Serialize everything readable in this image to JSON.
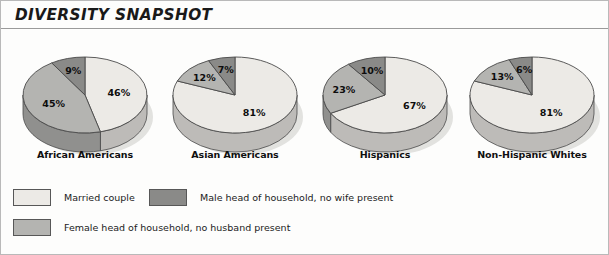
{
  "header": {
    "title": "DIVERSITY SNAPSHOT"
  },
  "colors": {
    "married": "#eceae6",
    "female_head": "#b4b4b1",
    "male_head": "#8a8a88",
    "outline": "#4a4a4a",
    "text": "#0d0d0d",
    "rule": "#9a9a9a",
    "page_border": "#b9b9b9"
  },
  "legend": {
    "items": [
      {
        "label": "Married couple",
        "key": "married"
      },
      {
        "label": "Male head of household, no wife present",
        "key": "male_head"
      },
      {
        "label": "Female head of household, no husband present",
        "key": "female_head"
      }
    ]
  },
  "chart_data": {
    "type": "pie",
    "title": "DIVERSITY SNAPSHOT",
    "xlabel": "",
    "ylabel": "",
    "units": "percent",
    "legend_position": "bottom-left",
    "grid": false,
    "categories": [
      "African Americans",
      "Asian Americans",
      "Hispanics",
      "Non-Hispanic Whites"
    ],
    "series": [
      {
        "name": "Married couple",
        "values": [
          46,
          81,
          67,
          81
        ]
      },
      {
        "name": "Female head of household, no husband present",
        "values": [
          45,
          12,
          23,
          13
        ]
      },
      {
        "name": "Male head of household, no wife present",
        "values": [
          9,
          7,
          10,
          6
        ]
      }
    ],
    "charts": [
      {
        "label": "African Americans",
        "slices": [
          {
            "name": "Married couple",
            "value": 46,
            "display": "46%",
            "key": "married"
          },
          {
            "name": "Female head of household, no husband present",
            "value": 45,
            "display": "45%",
            "key": "female_head"
          },
          {
            "name": "Male head of household, no wife present",
            "value": 9,
            "display": "9%",
            "key": "male_head"
          }
        ]
      },
      {
        "label": "Asian Americans",
        "slices": [
          {
            "name": "Married couple",
            "value": 81,
            "display": "81%",
            "key": "married"
          },
          {
            "name": "Female head of household, no husband present",
            "value": 12,
            "display": "12%",
            "key": "female_head"
          },
          {
            "name": "Male head of household, no wife present",
            "value": 7,
            "display": "7%",
            "key": "male_head"
          }
        ]
      },
      {
        "label": "Hispanics",
        "slices": [
          {
            "name": "Married couple",
            "value": 67,
            "display": "67%",
            "key": "married"
          },
          {
            "name": "Female head of household, no husband present",
            "value": 23,
            "display": "23%",
            "key": "female_head"
          },
          {
            "name": "Male head of household, no wife present",
            "value": 10,
            "display": "10%",
            "key": "male_head"
          }
        ]
      },
      {
        "label": "Non-Hispanic Whites",
        "slices": [
          {
            "name": "Married couple",
            "value": 81,
            "display": "81%",
            "key": "married"
          },
          {
            "name": "Female head of household, no husband present",
            "value": 13,
            "display": "13%",
            "key": "female_head"
          },
          {
            "name": "Male head of household, no wife present",
            "value": 6,
            "display": "6%",
            "key": "male_head"
          }
        ]
      }
    ]
  },
  "layout": {
    "pie_start_angle": [
      -90,
      -90,
      -90,
      -90
    ],
    "pie_positions_x": [
      8,
      158,
      308,
      455
    ]
  }
}
